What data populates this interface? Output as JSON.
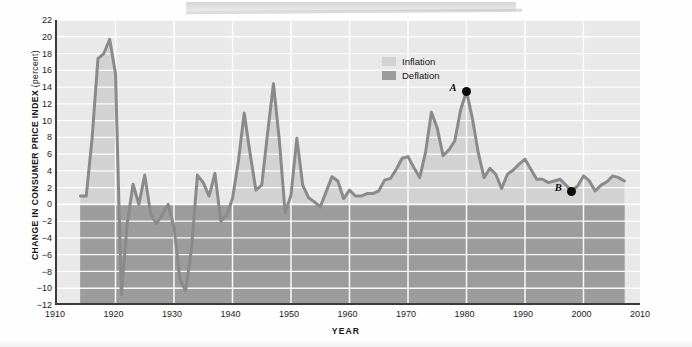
{
  "axes": {
    "y_title_main": "CHANGE  IN CONSUMER PRICE  INDEX",
    "y_title_unit": "(percent)",
    "x_title": "YEAR",
    "y_ticks": [
      22,
      20,
      18,
      16,
      14,
      12,
      10,
      8,
      6,
      4,
      2,
      0,
      -2,
      -4,
      -6,
      -8,
      -10,
      -12
    ],
    "y_tick_labels": [
      "22",
      "20",
      "18",
      "16",
      "14",
      "12",
      "10",
      "8",
      "6",
      "4",
      "2",
      "0",
      "−2",
      "−4",
      "−6",
      "−8",
      "−10",
      "−12"
    ],
    "x_ticks": [
      1910,
      1920,
      1930,
      1940,
      1950,
      1960,
      1970,
      1980,
      1990,
      2000,
      2010
    ],
    "x_tick_labels": [
      "1910",
      "1920",
      "1930",
      "1940",
      "1950",
      "1960",
      "1970",
      "1980",
      "1990",
      "2000",
      "2010"
    ]
  },
  "legend": {
    "position": "inside-top-center",
    "items": [
      {
        "label": "Inflation",
        "color": "#d2d2d2",
        "swatch": "inflation-swatch"
      },
      {
        "label": "Deflation",
        "color": "#9c9c9c",
        "swatch": "deflation-swatch"
      }
    ]
  },
  "annotations": [
    {
      "id": "A",
      "label": "A",
      "year": 1980,
      "value": 13.5,
      "label_side": "left"
    },
    {
      "id": "B",
      "label": "B",
      "year": 1998,
      "value": 1.6,
      "label_side": "left"
    }
  ],
  "colors": {
    "plot_background": "#e9e9e9",
    "inflation_fill": "#d2d2d2",
    "deflation_fill": "#9c9c9c",
    "line": "#8a8a8a",
    "gridline": "#ffffff",
    "axis": "#3a3a3a",
    "text": "#161616",
    "annotation": "#0b0b0b"
  },
  "chart_data": {
    "type": "line",
    "title": "",
    "subtitle": "",
    "xlabel": "YEAR",
    "ylabel": "CHANGE IN CONSUMER PRICE INDEX (percent)",
    "xlim": [
      1910,
      2010
    ],
    "ylim": [
      -12,
      22
    ],
    "grid": true,
    "ytick_step": 2,
    "xtick_step": 10,
    "legend_entries": [
      "Inflation",
      "Deflation"
    ],
    "fill_baseline": 0,
    "series": [
      {
        "name": "Change in Consumer Price Index (percent)",
        "x": [
          1914,
          1915,
          1916,
          1917,
          1918,
          1919,
          1920,
          1921,
          1922,
          1923,
          1924,
          1925,
          1926,
          1927,
          1928,
          1929,
          1930,
          1931,
          1932,
          1933,
          1934,
          1935,
          1936,
          1937,
          1938,
          1939,
          1940,
          1941,
          1942,
          1943,
          1944,
          1945,
          1946,
          1947,
          1948,
          1949,
          1950,
          1951,
          1952,
          1953,
          1954,
          1955,
          1956,
          1957,
          1958,
          1959,
          1960,
          1961,
          1962,
          1963,
          1964,
          1965,
          1966,
          1967,
          1968,
          1969,
          1970,
          1971,
          1972,
          1973,
          1974,
          1975,
          1976,
          1977,
          1978,
          1979,
          1980,
          1981,
          1982,
          1983,
          1984,
          1985,
          1986,
          1987,
          1988,
          1989,
          1990,
          1991,
          1992,
          1993,
          1994,
          1995,
          1996,
          1997,
          1998,
          1999,
          2000,
          2001,
          2002,
          2003,
          2004,
          2005,
          2006,
          2007
        ],
        "y": [
          1.0,
          1.0,
          7.9,
          17.4,
          18.0,
          19.7,
          15.6,
          -10.8,
          -2.3,
          2.4,
          0.0,
          3.5,
          -1.1,
          -2.3,
          -1.2,
          0.0,
          -2.7,
          -8.9,
          -10.3,
          -5.2,
          3.5,
          2.6,
          1.0,
          3.7,
          -2.0,
          -1.3,
          0.7,
          5.1,
          10.9,
          6.1,
          1.7,
          2.3,
          8.5,
          14.4,
          7.7,
          -1.0,
          1.1,
          7.9,
          2.3,
          0.8,
          0.3,
          -0.3,
          1.5,
          3.3,
          2.8,
          0.7,
          1.7,
          1.0,
          1.0,
          1.3,
          1.3,
          1.6,
          2.9,
          3.1,
          4.2,
          5.5,
          5.7,
          4.4,
          3.2,
          6.2,
          11.0,
          9.1,
          5.8,
          6.5,
          7.6,
          11.3,
          13.5,
          10.3,
          6.2,
          3.2,
          4.3,
          3.6,
          1.9,
          3.6,
          4.1,
          4.8,
          5.4,
          4.2,
          3.0,
          3.0,
          2.6,
          2.8,
          3.0,
          2.3,
          1.6,
          2.2,
          3.4,
          2.8,
          1.6,
          2.3,
          2.7,
          3.4,
          3.2,
          2.8
        ]
      }
    ]
  }
}
